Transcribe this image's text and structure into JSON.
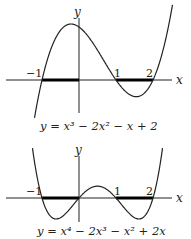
{
  "graphs": [
    {
      "equation": "y = x³ − 2x² − x + 2",
      "axis_x": "x",
      "axis_y": "y",
      "ticks": [
        "−1",
        "1",
        "2"
      ],
      "highlighted_intervals": [
        [
          -1,
          0
        ],
        [
          1,
          2
        ]
      ],
      "coefficients": [
        1,
        -2,
        -1,
        2
      ]
    },
    {
      "equation": "y = x⁴ − 2x³ − x² + 2x",
      "axis_x": "x",
      "axis_y": "y",
      "ticks": [
        "−1",
        "1",
        "2"
      ],
      "highlighted_intervals": [
        [
          -1,
          0
        ],
        [
          1,
          2
        ]
      ],
      "coefficients": [
        1,
        -2,
        -1,
        2,
        0
      ]
    }
  ]
}
